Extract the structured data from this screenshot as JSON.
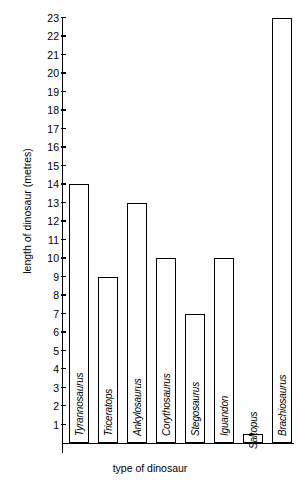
{
  "chart_data": {
    "type": "bar",
    "title": "",
    "xlabel": "type of dinosaur",
    "ylabel": "length of dinosaur (metres)",
    "categories": [
      "Tyrannosaurus",
      "Triceratops",
      "Ankylosaurus",
      "Corythosaurus",
      "Stegosaurus",
      "Iguandon",
      "Saltopus",
      "Brachiosaurus"
    ],
    "values": [
      14,
      9,
      13,
      10,
      7,
      10,
      0.5,
      23
    ],
    "ylim": [
      0,
      23
    ],
    "ytick_labels": [
      "23",
      "22",
      "21",
      "20",
      "19",
      "18",
      "17",
      "16",
      "15",
      "14",
      "13",
      "12",
      "11",
      "10",
      "9",
      "8",
      "7",
      "6",
      "5",
      "4",
      "3",
      "2",
      "1"
    ],
    "ytick_values": [
      23,
      22,
      21,
      20,
      19,
      18,
      17,
      16,
      15,
      14,
      13,
      12,
      11,
      10,
      9,
      8,
      7,
      6,
      5,
      4,
      3,
      2,
      1
    ],
    "grid": false,
    "legend": null,
    "bar_style": {
      "fill": "#ffffff",
      "stroke": "#000000"
    }
  },
  "top_artifact": "",
  "axes": {
    "y_title": "length of dinosaur (metres)",
    "x_title": "type of dinosaur"
  }
}
